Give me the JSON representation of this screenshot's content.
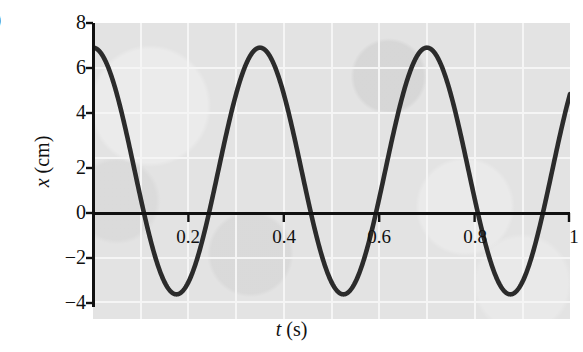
{
  "figure": {
    "label_fragment": ")",
    "panel_background": "#e3e3e3",
    "curve_color": "#2b2b2b",
    "axis_color": "#111111",
    "gridline_color": "#f4f4f4"
  },
  "chart_data": {
    "type": "line",
    "title": "",
    "subtitle": "",
    "xlabel": "t (s)",
    "ylabel": "x (cm)",
    "xlabel_symbol": "t",
    "xlabel_unit": "(s)",
    "ylabel_symbol": "x",
    "ylabel_unit": "(cm)",
    "xlim": [
      0,
      1.0
    ],
    "ylim": [
      -4,
      8
    ],
    "xticks": [
      0.2,
      0.4,
      0.6,
      0.8,
      1
    ],
    "xtick_labels": [
      "0.2",
      "0.4",
      "0.6",
      "0.8",
      "1"
    ],
    "yticks": [
      -4,
      -2,
      0,
      2,
      4,
      6,
      8
    ],
    "ytick_labels": [
      "−4",
      "−2",
      "0",
      "2",
      "4",
      "6",
      "8"
    ],
    "grid": true,
    "grid_style": "light white lines on gray paper background",
    "legend": "none",
    "waveform": {
      "description": "Simple harmonic oscillation, cosine form",
      "equation": "x(t) = 2 + 5 cos(2πt / 0.35)",
      "amplitude_cm": 5,
      "offset_cm": 2,
      "maximum_cm": 7,
      "minimum_cm": -3,
      "period_s": 0.35,
      "frequency_hz": 2.86,
      "phase": 0,
      "cycles_shown": 2.9
    },
    "series": [
      {
        "name": "x(t)",
        "x": [
          0,
          0.025,
          0.05,
          0.075,
          0.1,
          0.125,
          0.15,
          0.175,
          0.2,
          0.225,
          0.25,
          0.275,
          0.3,
          0.325,
          0.35,
          0.375,
          0.4,
          0.425,
          0.45,
          0.475,
          0.5,
          0.525,
          0.55,
          0.575,
          0.6,
          0.625,
          0.65,
          0.675,
          0.7,
          0.725,
          0.75,
          0.775,
          0.8,
          0.825,
          0.85,
          0.875,
          0.9,
          0.925,
          0.95,
          0.975,
          1.0
        ],
        "values": [
          7.0,
          6.5,
          5.2,
          3.3,
          1.2,
          -0.7,
          -2.2,
          -2.9,
          -3.0,
          -2.3,
          -0.9,
          1.0,
          3.1,
          4.9,
          6.3,
          6.9,
          6.8,
          5.9,
          4.3,
          2.3,
          0.3,
          -1.5,
          -2.6,
          -3.0,
          -2.7,
          -1.7,
          0.0,
          2.0,
          4.0,
          5.7,
          6.7,
          7.0,
          6.5,
          5.3,
          3.4,
          1.3,
          -0.6,
          -2.1,
          -2.9,
          -3.0,
          -2.4
        ],
        "zero_crossings_s": [
          0.145,
          0.253,
          0.495,
          0.603,
          0.845,
          0.953
        ],
        "peaks_s": [
          0,
          0.35,
          0.7
        ],
        "troughs_s": [
          0.175,
          0.525,
          0.875
        ]
      }
    ]
  }
}
